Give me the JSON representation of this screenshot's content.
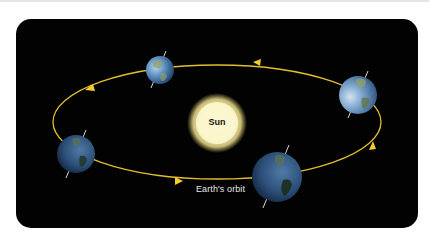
{
  "diagram": {
    "title": "",
    "sun": {
      "label": "Sun",
      "color": "#fff6c8",
      "glow": "#f5e9a0"
    },
    "orbit": {
      "label": "Earth's orbit",
      "color": "#e8c22a",
      "direction": "counter-clockwise (as viewed)"
    },
    "earths": [
      {
        "position": "top",
        "size": "small"
      },
      {
        "position": "right",
        "size": "medium"
      },
      {
        "position": "bottom-right",
        "size": "large"
      },
      {
        "position": "left",
        "size": "medium"
      }
    ],
    "arrows": [
      "top-right",
      "top-left",
      "bottom-center",
      "right"
    ],
    "colors": {
      "background": "#020202",
      "page": "#ffffff",
      "earth_ocean": "#3d6fa6",
      "earth_land": "#6f8a55"
    }
  }
}
